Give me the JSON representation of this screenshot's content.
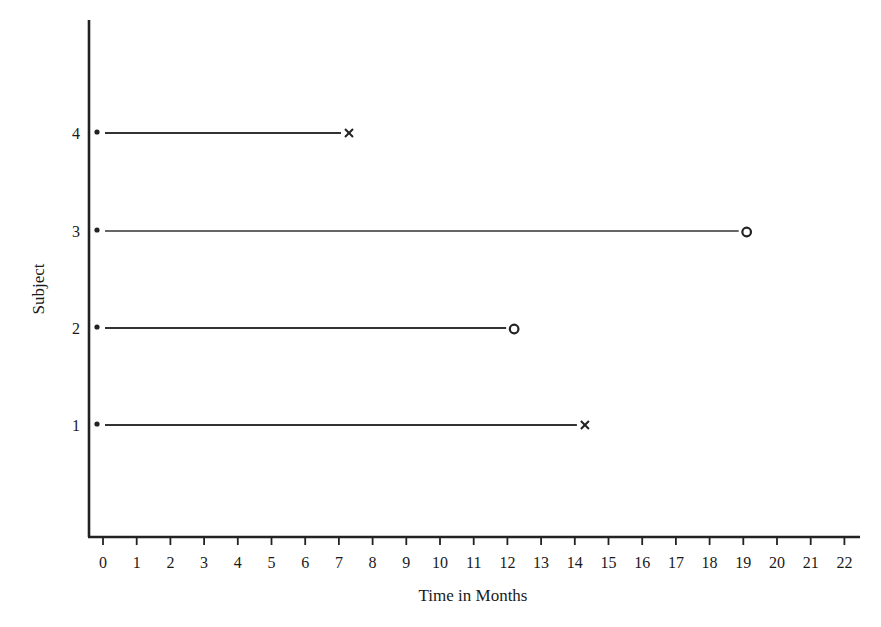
{
  "chart_data": {
    "type": "line",
    "subtype": "subject timeline / survival follow-up plot",
    "title": "",
    "xlabel": "Time in Months",
    "ylabel": "Subject",
    "xlim": [
      0,
      22
    ],
    "x_ticks": [
      0,
      1,
      2,
      3,
      4,
      5,
      6,
      7,
      8,
      9,
      10,
      11,
      12,
      13,
      14,
      15,
      16,
      17,
      18,
      19,
      20,
      21,
      22
    ],
    "y_ticks": [
      1,
      2,
      3,
      4
    ],
    "grid": false,
    "legend": null,
    "markers": {
      "start": "dot",
      "event": "x",
      "censored": "o"
    },
    "series": [
      {
        "name": "Subject 1",
        "subject": 1,
        "start": 0,
        "end": 14.3,
        "end_marker": "x",
        "status": "event"
      },
      {
        "name": "Subject 2",
        "subject": 2,
        "start": 0,
        "end": 12.2,
        "end_marker": "o",
        "status": "censored"
      },
      {
        "name": "Subject 3",
        "subject": 3,
        "start": 0,
        "end": 19.1,
        "end_marker": "o",
        "status": "censored"
      },
      {
        "name": "Subject 4",
        "subject": 4,
        "start": 0,
        "end": 7.3,
        "end_marker": "x",
        "status": "event"
      }
    ]
  }
}
